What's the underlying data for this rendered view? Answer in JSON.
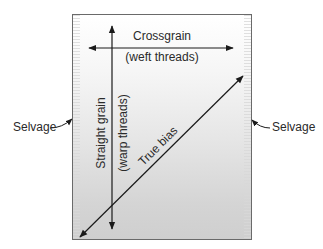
{
  "diagram": {
    "labels": {
      "crossgrain_title": "Crossgrain",
      "crossgrain_sub": "(weft threads)",
      "straight_grain": "Straight grain",
      "warp_threads": "(warp threads)",
      "true_bias": "True bias",
      "selvage_left": "Selvage",
      "selvage_right": "Selvage"
    },
    "colors": {
      "line": "#1a1a1a",
      "fabric_border": "#6a6a6a",
      "fabric_top": "#ffffff",
      "fabric_bottom": "#cfcfcf",
      "text": "#2a2a2a"
    },
    "arrows": [
      {
        "name": "crossgrain",
        "type": "double",
        "from": [
          89,
          48
        ],
        "to": [
          233,
          48
        ]
      },
      {
        "name": "straight-grain",
        "type": "double",
        "from": [
          112,
          26
        ],
        "to": [
          112,
          229
        ]
      },
      {
        "name": "true-bias",
        "type": "double",
        "from": [
          80,
          237
        ],
        "to": [
          243,
          76
        ]
      },
      {
        "name": "selvage-left-pointer",
        "type": "single",
        "from": [
          50,
          128
        ],
        "to": [
          72,
          119
        ]
      },
      {
        "name": "selvage-right-pointer",
        "type": "single",
        "from": [
          270,
          128
        ],
        "to": [
          252,
          120
        ]
      }
    ]
  }
}
